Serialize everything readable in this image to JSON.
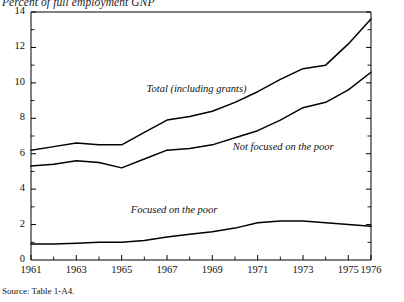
{
  "chart_data": {
    "type": "line",
    "title": "Percent of full employment GNP",
    "xlabel": "",
    "ylabel": "Percent of full employment GNP",
    "source": "Source: Table 1-A4.",
    "grid": false,
    "legend_position": "inline-annotations",
    "xlim": [
      1961,
      1976
    ],
    "ylim": [
      0,
      14
    ],
    "y_ticks": [
      0,
      2,
      4,
      6,
      8,
      10,
      12,
      14
    ],
    "y_tick_labels": [
      "0",
      "2",
      "4",
      "6",
      "8",
      "10",
      "12",
      "14"
    ],
    "y_minor_ticks": [
      1,
      3,
      5,
      7,
      9,
      11,
      13
    ],
    "x_ticks": [
      1961,
      1963,
      1965,
      1967,
      1969,
      1971,
      1973,
      1975,
      1976
    ],
    "x_tick_labels": [
      "1961",
      "1963",
      "1965",
      "1967",
      "1969",
      "1971",
      "1973",
      "1975",
      "1976"
    ],
    "x_minor_ticks": [
      1962,
      1964,
      1966,
      1968,
      1970,
      1972,
      1974
    ],
    "x": [
      1961,
      1962,
      1963,
      1964,
      1965,
      1966,
      1967,
      1968,
      1969,
      1970,
      1971,
      1972,
      1973,
      1974,
      1975,
      1976
    ],
    "series": [
      {
        "name": "Total (including grants)",
        "label_x": 1966.1,
        "label_y": 9.6,
        "values": [
          6.2,
          6.4,
          6.6,
          6.5,
          6.5,
          7.2,
          7.9,
          8.1,
          8.4,
          8.9,
          9.5,
          10.2,
          10.8,
          11.0,
          12.2,
          13.6
        ]
      },
      {
        "name": "Not focused on the poor",
        "label_x": 1969.9,
        "label_y": 6.3,
        "values": [
          5.3,
          5.4,
          5.6,
          5.5,
          5.2,
          5.7,
          6.2,
          6.3,
          6.5,
          6.9,
          7.3,
          7.9,
          8.6,
          8.9,
          9.6,
          10.6
        ]
      },
      {
        "name": "Focused on the poor",
        "label_x": 1965.4,
        "label_y": 2.75,
        "values": [
          0.9,
          0.9,
          0.95,
          1.0,
          1.0,
          1.1,
          1.3,
          1.45,
          1.6,
          1.8,
          2.1,
          2.2,
          2.2,
          2.1,
          2.0,
          1.9
        ]
      }
    ]
  }
}
